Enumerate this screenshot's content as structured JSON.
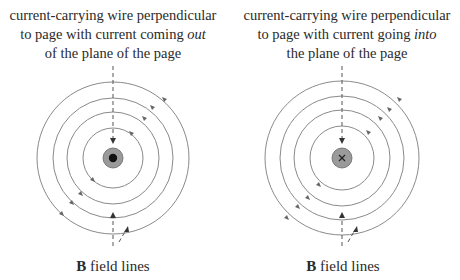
{
  "left_panel": {
    "caption_line1": "current-carrying wire perpendicular",
    "caption_line2_prefix": "to page with current coming ",
    "caption_line2_emph": "out",
    "caption_line3": "of the plane of the page",
    "wire_symbol": "dot",
    "field_direction": "counterclockwise",
    "label_bold": "B",
    "label_rest": " field lines"
  },
  "right_panel": {
    "caption_line1": "current-carrying wire perpendicular",
    "caption_line2_prefix": "to page with current going ",
    "caption_line2_emph": "into",
    "caption_line3": "the plane of the page",
    "wire_symbol": "cross",
    "field_direction": "clockwise",
    "label_bold": "B",
    "label_rest": " field lines"
  },
  "colors": {
    "circle_stroke": "#8a8a8a",
    "wire_fill": "#9a9a9a",
    "wire_center": "#111111",
    "text": "#2a2a2a"
  }
}
